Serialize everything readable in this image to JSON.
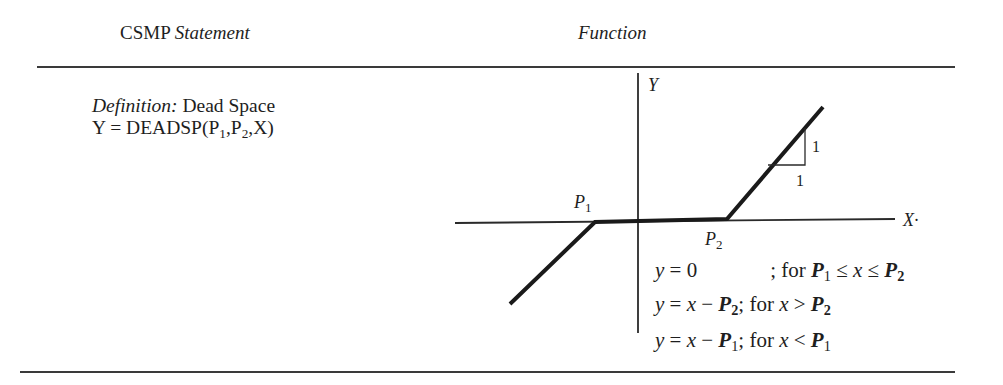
{
  "header": {
    "col1_prefix": "CSMP",
    "col1_italic": "Statement",
    "col2": "Function"
  },
  "statement": {
    "definition_label": "Definition:",
    "definition_name": "Dead Space",
    "formula_prefix": "Y = DEADSP(P",
    "formula_sub1": "1",
    "formula_mid": ",P",
    "formula_sub2": "2",
    "formula_suffix": ",X)"
  },
  "graph": {
    "y_axis_label": "Y",
    "x_axis_label": "X·",
    "p1_label": "P",
    "p1_sub": "1",
    "p2_label": "P",
    "p2_sub": "2",
    "slope_rise": "1",
    "slope_run": "1"
  },
  "equations": [
    {
      "lhs": "y = 0",
      "condition": "; for P₁ ≤ x ≤ P₂"
    },
    {
      "lhs": "y = x − P₂",
      "condition": "; for x > P₂"
    },
    {
      "lhs": "y = x − P₁",
      "condition": "; for x < P₁"
    }
  ],
  "eq": {
    "row1": {
      "y": "y",
      "eq": " = 0",
      "for": "; for ",
      "p": "P",
      "s1": "1",
      "le1": " ≤ ",
      "x": "x",
      "le2": " ≤ ",
      "s2": "2"
    },
    "row2": {
      "y": "y",
      "eq": " = ",
      "x": "x",
      "minus": " − ",
      "p": "P",
      "s": "2",
      "for": "; for ",
      "gt": " > "
    },
    "row3": {
      "y": "y",
      "eq": " = ",
      "x": "x",
      "minus": " − ",
      "p": "P",
      "s": "1",
      "for": "; for ",
      "lt": " < "
    }
  }
}
